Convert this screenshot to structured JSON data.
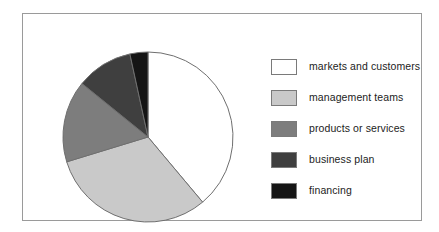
{
  "figure": {
    "border_color": "#9a9a9a",
    "background": "#ffffff"
  },
  "chart_data": {
    "type": "pie",
    "title": "",
    "subtitle": "",
    "xlabel": "",
    "ylabel": "",
    "grid": false,
    "legend_position": "right",
    "start_angle_deg": 0,
    "direction": "clockwise",
    "center": {
      "x": 86,
      "y": 86
    },
    "radius": 85,
    "categories": [
      "markets and customers",
      "management teams",
      "products or services",
      "business plan",
      "financing"
    ],
    "values": [
      38.9,
      31.4,
      15.6,
      10.7,
      3.4
    ],
    "angles_deg": [
      140.0,
      113.0,
      56.0,
      38.7,
      12.3
    ],
    "colors": [
      "#ffffff",
      "#c9c9c9",
      "#7d7d7d",
      "#3f3f3f",
      "#151515"
    ],
    "edge_color": "#6f6f6f",
    "slices": [
      {
        "label": "markets and customers",
        "value": 38.9,
        "angle_deg": 140.0,
        "color": "#ffffff",
        "start_deg": 0.0,
        "end_deg": 140.0
      },
      {
        "label": "management teams",
        "value": 31.4,
        "angle_deg": 113.0,
        "color": "#c9c9c9",
        "start_deg": 140.0,
        "end_deg": 253.0
      },
      {
        "label": "products or services",
        "value": 15.6,
        "angle_deg": 56.0,
        "color": "#7d7d7d",
        "start_deg": 253.0,
        "end_deg": 309.0
      },
      {
        "label": "business plan",
        "value": 10.7,
        "angle_deg": 38.7,
        "color": "#3f3f3f",
        "start_deg": 309.0,
        "end_deg": 347.7
      },
      {
        "label": "financing",
        "value": 3.4,
        "angle_deg": 12.3,
        "color": "#151515",
        "start_deg": 347.7,
        "end_deg": 360.0
      }
    ]
  },
  "legend": {
    "items": [
      {
        "label": "markets and customers",
        "color": "#ffffff"
      },
      {
        "label": "management teams",
        "color": "#c9c9c9"
      },
      {
        "label": "products or services",
        "color": "#7d7d7d"
      },
      {
        "label": "business plan",
        "color": "#3f3f3f"
      },
      {
        "label": "financing",
        "color": "#151515"
      }
    ]
  }
}
